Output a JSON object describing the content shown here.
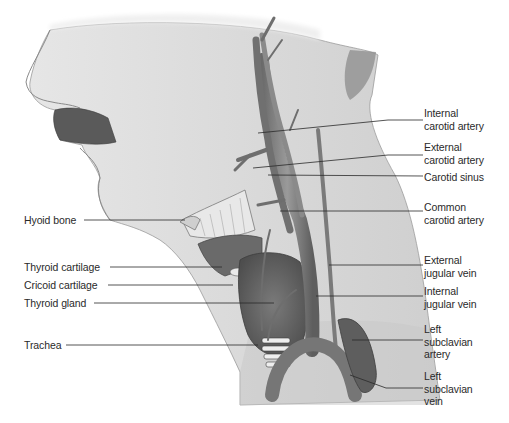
{
  "figure": {
    "colors": {
      "background": "#ffffff",
      "skin": "#d9d9d9",
      "skin_dark": "#bdbdbd",
      "vessel": "#8a8a8a",
      "vessel_dark": "#5a5a5a",
      "gland": "#6e6e6e",
      "cartilage": "#c8c8c8",
      "leader_line": "#2a2a2a",
      "text": "#2a2a2a"
    }
  },
  "labels": {
    "left": [
      {
        "id": "hyoid-bone",
        "text": "Hyoid bone"
      },
      {
        "id": "thyroid-cartilage",
        "text": "Thyroid cartilage"
      },
      {
        "id": "cricoid-cartilage",
        "text": "Cricoid cartilage"
      },
      {
        "id": "thyroid-gland",
        "text": "Thyroid gland"
      },
      {
        "id": "trachea",
        "text": "Trachea"
      }
    ],
    "right": [
      {
        "id": "internal-carotid-artery",
        "text": "Internal\ncarotid artery"
      },
      {
        "id": "external-carotid-artery",
        "text": "External\ncarotid artery"
      },
      {
        "id": "carotid-sinus",
        "text": "Carotid sinus"
      },
      {
        "id": "common-carotid-artery",
        "text": "Common\ncarotid artery"
      },
      {
        "id": "external-jugular-vein",
        "text": "External\njugular vein"
      },
      {
        "id": "internal-jugular-vein",
        "text": "Internal\njugular vein"
      },
      {
        "id": "left-subclavian-artery",
        "text": "Left\nsubclavian\nartery"
      },
      {
        "id": "left-subclavian-vein",
        "text": "Left\nsubclavian\nvein"
      }
    ]
  }
}
